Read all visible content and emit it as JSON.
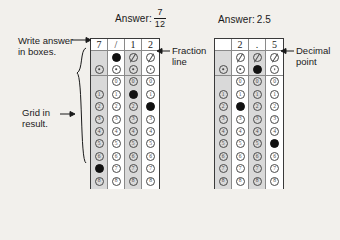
{
  "page": {
    "background_color": "#f2f0ec",
    "ink_color": "#1a1a1a",
    "bubble_fill_color": "#111111",
    "shade_color": "#d9d9d9"
  },
  "examples": [
    {
      "id": "fraction-example",
      "answer_prefix": "Answer:",
      "answer_kind": "fraction",
      "answer_numerator": "7",
      "answer_denominator": "12",
      "answer_text": "7/12",
      "write_row": [
        "7",
        "/",
        "1",
        "2"
      ],
      "slash_row": [
        false,
        true,
        false,
        false
      ],
      "point_row": [
        false,
        false,
        false,
        false
      ],
      "digit_labels": [
        "0",
        "1",
        "2",
        "3",
        "4",
        "5",
        "6",
        "7",
        "8",
        "9"
      ],
      "columns": [
        {
          "index": 1,
          "shaded": true,
          "written": "7",
          "zero_bubble": false,
          "marked_digit": "7"
        },
        {
          "index": 2,
          "shaded": false,
          "written": "/",
          "zero_bubble": true,
          "marked_digit": null
        },
        {
          "index": 3,
          "shaded": true,
          "written": "1",
          "zero_bubble": true,
          "marked_digit": "1"
        },
        {
          "index": 4,
          "shaded": false,
          "written": "2",
          "zero_bubble": true,
          "marked_digit": "2"
        }
      ]
    },
    {
      "id": "decimal-example",
      "answer_prefix": "Answer:",
      "answer_kind": "decimal",
      "answer_numerator": "",
      "answer_denominator": "",
      "answer_text": "2.5",
      "write_row": [
        "",
        "2",
        ".",
        "5"
      ],
      "slash_row": [
        false,
        false,
        false,
        false
      ],
      "point_row": [
        false,
        false,
        true,
        false
      ],
      "digit_labels": [
        "0",
        "1",
        "2",
        "3",
        "4",
        "5",
        "6",
        "7",
        "8",
        "9"
      ],
      "columns": [
        {
          "index": 1,
          "shaded": true,
          "written": "",
          "zero_bubble": false,
          "marked_digit": null
        },
        {
          "index": 2,
          "shaded": false,
          "written": "2",
          "zero_bubble": true,
          "marked_digit": "2"
        },
        {
          "index": 3,
          "shaded": true,
          "written": ".",
          "zero_bubble": true,
          "marked_digit": null
        },
        {
          "index": 4,
          "shaded": false,
          "written": "5",
          "zero_bubble": true,
          "marked_digit": "5"
        }
      ]
    }
  ],
  "callouts": {
    "write_answer": {
      "line1": "Write answer",
      "line2": "in boxes."
    },
    "grid_in_result": {
      "line1": "Grid in",
      "line2": "result."
    },
    "fraction_line": {
      "line1": "Fraction",
      "line2": "line"
    },
    "decimal_point": {
      "line1": "Decimal",
      "line2": "point"
    }
  }
}
